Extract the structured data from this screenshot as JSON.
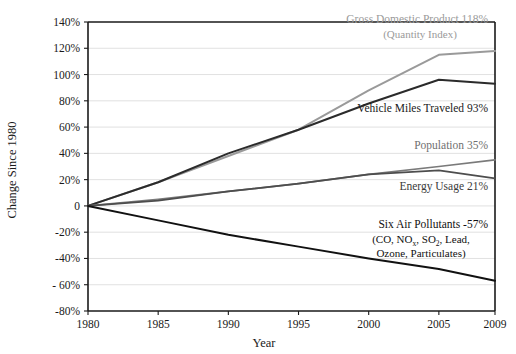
{
  "chart_data": {
    "type": "line",
    "title": "",
    "xlabel": "Year",
    "ylabel": "Change Since 1980",
    "x": [
      1980,
      1985,
      1990,
      1995,
      2000,
      2005,
      2009
    ],
    "xlim": [
      1980,
      2009
    ],
    "ylim": [
      -80,
      140
    ],
    "grid": true,
    "legend_position": "inline-annotations",
    "xtick_labels": [
      "1980",
      "1985",
      "1990",
      "1995",
      "2000",
      "2005",
      "2009"
    ],
    "ytick_labels": [
      "140%",
      "120%",
      "100%",
      "80%",
      "60%",
      "40%",
      "20%",
      "0",
      "-20%",
      "-40%",
      "- 60%",
      "-80%"
    ],
    "ytick_values": [
      140,
      120,
      100,
      80,
      60,
      40,
      20,
      0,
      -20,
      -40,
      -60,
      -80
    ],
    "series": [
      {
        "name": "Gross Domestic Product",
        "sublabel": "(Quantity Index)",
        "final_value": "118%",
        "color": "#9a9a9a",
        "width": 2.0,
        "values": [
          0,
          18,
          38,
          58,
          88,
          115,
          118
        ]
      },
      {
        "name": "Vehicle Miles Traveled",
        "sublabel": "",
        "final_value": "93%",
        "color": "#2b2b2b",
        "width": 2.0,
        "values": [
          0,
          18,
          40,
          58,
          78,
          96,
          93
        ]
      },
      {
        "name": "Population",
        "sublabel": "",
        "final_value": "35%",
        "color": "#7a7a7a",
        "width": 1.7,
        "values": [
          0,
          5,
          11,
          17,
          24,
          30,
          35
        ]
      },
      {
        "name": "Energy Usage",
        "sublabel": "",
        "final_value": "21%",
        "color": "#4d4d4d",
        "width": 1.7,
        "values": [
          0,
          4,
          11,
          17,
          24,
          27,
          21
        ]
      },
      {
        "name": "Six Air Pollutants",
        "sublabel": "(CO, NOx, SO2, Lead, Ozone, Particulates)",
        "final_value": "-57%",
        "color": "#111111",
        "width": 2.0,
        "values": [
          0,
          -11,
          -22,
          -31,
          -40,
          -48,
          -57
        ]
      }
    ],
    "annotations": [
      {
        "id": "gdp",
        "line1": "Gross Domestic Product  118%",
        "line2": "(Quantity Index)",
        "color": "#9a9a9a"
      },
      {
        "id": "vmt",
        "line1": "Vehicle Miles Traveled  93%",
        "line2": "",
        "color": "#1a1a1a"
      },
      {
        "id": "population",
        "line1": "Population  35%",
        "line2": "",
        "color": "#6f6f6f"
      },
      {
        "id": "energy",
        "line1": "Energy Usage  21%",
        "line2": "",
        "color": "#3a3a3a"
      },
      {
        "id": "pollutants",
        "line1": "Six Air Pollutants  -57%",
        "line2a": "(CO, NO",
        "line2b": "x",
        "line2c": ", SO",
        "line2d": "2",
        "line2e": ", Lead,",
        "line3": "Ozone, Particulates)",
        "color": "#111111"
      }
    ]
  }
}
